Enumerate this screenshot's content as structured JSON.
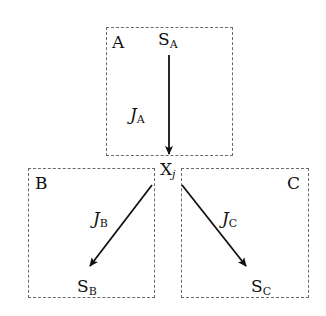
{
  "diagram": {
    "boxes": [
      {
        "id": "A",
        "label": "A",
        "x": 106,
        "y": 27,
        "w": 127,
        "h": 129
      },
      {
        "id": "B",
        "label": "B",
        "x": 28,
        "y": 168,
        "w": 127,
        "h": 130
      },
      {
        "id": "C",
        "label": "C",
        "x": 181,
        "y": 168,
        "w": 128,
        "h": 130
      }
    ],
    "nodes": {
      "SA": {
        "main": "S",
        "sub": "A"
      },
      "SB": {
        "main": "S",
        "sub": "B"
      },
      "SC": {
        "main": "S",
        "sub": "C"
      },
      "Xj": {
        "main": "X",
        "sub": "j"
      }
    },
    "edges": [
      {
        "from": "SA",
        "to": "Xj",
        "label_main": "J",
        "label_sub": "A"
      },
      {
        "from": "Xj",
        "to": "SB",
        "label_main": "J",
        "label_sub": "B"
      },
      {
        "from": "Xj",
        "to": "SC",
        "label_main": "J",
        "label_sub": "C"
      }
    ],
    "colors": {
      "box_border": "#6a6a6a",
      "arrow": "#111111",
      "text": "#111111"
    }
  }
}
